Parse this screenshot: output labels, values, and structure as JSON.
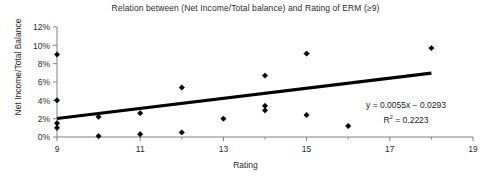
{
  "chart_data": {
    "type": "scatter",
    "title": "Relation between (Net Income/Total balance) and Rating of ERM (≥9)",
    "xlabel": "Rating",
    "ylabel": "Net Income/Total Balance",
    "xlim": [
      9,
      19
    ],
    "ylim": [
      0,
      0.12
    ],
    "xticks": [
      9,
      11,
      13,
      15,
      17,
      19
    ],
    "xtick_labels": [
      "9",
      "11",
      "13",
      "15",
      "17",
      "19"
    ],
    "x_minor_ticks": [
      10,
      12,
      14,
      16,
      18
    ],
    "yticks": [
      0,
      0.02,
      0.04,
      0.06,
      0.08,
      0.1,
      0.12
    ],
    "ytick_labels": [
      "0%",
      "2%",
      "4%",
      "6%",
      "8%",
      "10%",
      "12%"
    ],
    "grid": false,
    "legend": false,
    "marker": "diamond",
    "marker_color": "#000000",
    "points": [
      {
        "x": 9,
        "y": 0.09
      },
      {
        "x": 9,
        "y": 0.04
      },
      {
        "x": 9,
        "y": 0.015
      },
      {
        "x": 9,
        "y": 0.01
      },
      {
        "x": 10,
        "y": 0.022
      },
      {
        "x": 10,
        "y": 0.001
      },
      {
        "x": 11,
        "y": 0.026
      },
      {
        "x": 11,
        "y": 0.003
      },
      {
        "x": 12,
        "y": 0.054
      },
      {
        "x": 12,
        "y": 0.005
      },
      {
        "x": 13,
        "y": 0.02
      },
      {
        "x": 14,
        "y": 0.067
      },
      {
        "x": 14,
        "y": 0.034
      },
      {
        "x": 14,
        "y": 0.029
      },
      {
        "x": 15,
        "y": 0.091
      },
      {
        "x": 15,
        "y": 0.024
      },
      {
        "x": 16,
        "y": 0.012
      },
      {
        "x": 18,
        "y": 0.097
      }
    ],
    "trendline": {
      "slope": 0.0055,
      "intercept": -0.0293,
      "x_start": 9,
      "x_end": 18,
      "color": "#000000"
    },
    "annotations": {
      "equation": "y = 0.0055x − 0.0293",
      "r_squared_prefix": "R",
      "r_squared_exponent": "2",
      "r_squared_value": " = 0.2223"
    }
  },
  "colors": {
    "axis": "#808080",
    "text": "#2b2b2b",
    "marker": "#000000",
    "trendline": "#000000",
    "background": "#ffffff"
  }
}
